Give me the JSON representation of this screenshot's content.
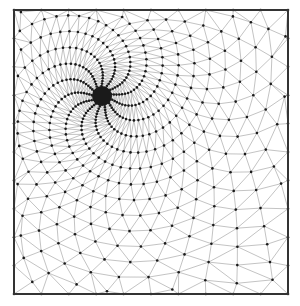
{
  "diagram": {
    "type": "triangular-mesh",
    "frame": {
      "x": 14,
      "y": 10,
      "width": 274,
      "height": 284,
      "stroke": "#333333",
      "stroke_width": 2
    },
    "refinement_center": {
      "x": 102,
      "y": 96
    },
    "node_count": 900,
    "spiral_twist": 2.2,
    "edge_color": "#9a9a9a",
    "node_color": "#1a1a1a",
    "node_radius": 1.3,
    "background": "#ffffff"
  }
}
